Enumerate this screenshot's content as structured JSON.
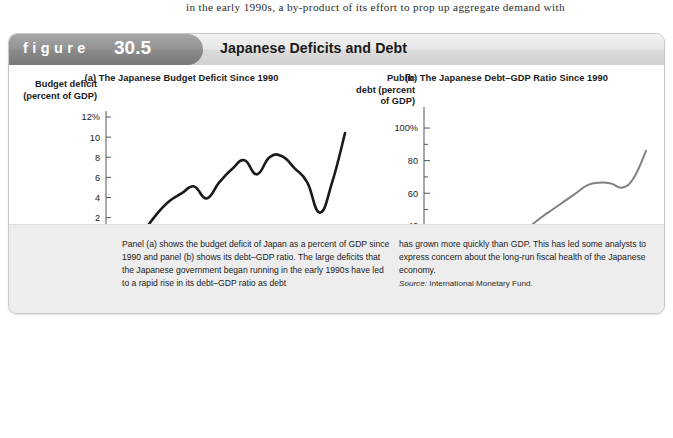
{
  "page": {
    "body_text_line": "in the early 1990s, a by-product of its effort to prop up aggregate demand with"
  },
  "figure": {
    "label_word": "figure",
    "number": "30.5",
    "title": "Japanese Deficits and Debt",
    "caption_left": "Panel (a) shows the budget deficit of Japan as a percent of GDP since 1990 and panel (b) shows its debt–GDP ratio. The large deficits that the Japanese government began running in the early 1990s have led to a rapid rise in its debt–GDP ratio as debt",
    "caption_right": "has grown more quickly than GDP. This has led some analysts to express concern about the long-run fiscal health of the Japanese economy.",
    "source_label": "Source:",
    "source_text": "International Monetary Fund."
  },
  "colors": {
    "line_a": "#1a1a1a",
    "line_b": "#808080",
    "axis": "#555555",
    "zero_line": "#8c8c8c",
    "tab": "#8a8a8a",
    "caption_bg": "#ededed"
  },
  "chart_data": [
    {
      "type": "line",
      "panel": "a",
      "title": "(a) The Japanese Budget Deficit Since 1990",
      "xlabel": "Year",
      "ylabel": "Budget deficit (percent of GDP)",
      "ylabel_lines": [
        "Budget deficit",
        "(percent of GDP)"
      ],
      "yticks": [
        12,
        10,
        8,
        6,
        4,
        2,
        0,
        -2,
        -4
      ],
      "ytick_labels": [
        "12%",
        "10",
        "8",
        "6",
        "4",
        "2",
        "0",
        "-2",
        "-4"
      ],
      "ylim": [
        -4,
        12
      ],
      "xlim": [
        1990,
        2009
      ],
      "xticks": [
        1990,
        1991,
        1992,
        1993,
        1994,
        1995,
        1996,
        1997,
        1998,
        1999,
        2000,
        2001,
        2002,
        2003,
        2004,
        2005,
        2006,
        2007,
        2008,
        2009
      ],
      "xtick_labels": [
        "1990",
        "1992",
        "1994",
        "1996",
        "1998",
        "2000",
        "2002",
        "2004",
        "2006",
        "2008",
        "2009"
      ],
      "xtick_label_years": [
        1990,
        1992,
        1994,
        1996,
        1998,
        2000,
        2002,
        2004,
        2006,
        2008,
        2009
      ],
      "zero_reference_line": 0,
      "grid": false,
      "legend": "none",
      "x": [
        1990,
        1991,
        1992,
        1993,
        1994,
        1995,
        1996,
        1997,
        1998,
        1999,
        2000,
        2001,
        2002,
        2003,
        2004,
        2005,
        2006,
        2007,
        2008,
        2009
      ],
      "values": [
        -2.1,
        -2.0,
        -1.5,
        0.6,
        2.3,
        3.6,
        4.4,
        5.1,
        3.9,
        5.5,
        6.8,
        7.7,
        6.3,
        8.0,
        8.1,
        6.9,
        5.5,
        2.5,
        5.6,
        10.4
      ]
    },
    {
      "type": "line",
      "panel": "b",
      "title": "(b) The Japanese Debt–GDP Ratio Since 1990",
      "xlabel": "Year",
      "ylabel": "Public debt (percent of GDP)",
      "ylabel_lines": [
        "Public",
        "debt (percent",
        "of GDP)"
      ],
      "yticks": [
        100,
        80,
        60,
        40,
        20
      ],
      "ytick_labels": [
        "100%",
        "80",
        "60",
        "40",
        "20"
      ],
      "ylim": [
        8,
        108
      ],
      "xlim": [
        1990,
        2009
      ],
      "xtick_labels": [
        "1990",
        "1992",
        "1994",
        "1996",
        "1998",
        "2000",
        "2002",
        "2004",
        "2006",
        "2008",
        "2009"
      ],
      "xtick_label_years": [
        1990,
        1992,
        1994,
        1996,
        1998,
        2000,
        2002,
        2004,
        2006,
        2008,
        2009
      ],
      "grid": false,
      "legend": "none",
      "x": [
        1990,
        1991,
        1992,
        1993,
        1994,
        1995,
        1996,
        1997,
        1998,
        1999,
        2000,
        2001,
        2002,
        2003,
        2004,
        2005,
        2006,
        2007,
        2008,
        2009
      ],
      "values": [
        14.0,
        12.5,
        13.0,
        15.0,
        17.5,
        20.0,
        23.0,
        26.5,
        31.0,
        39.0,
        45.0,
        50.0,
        55.0,
        60.0,
        65.0,
        66.5,
        66.0,
        63.5,
        70.0,
        86.0
      ]
    }
  ]
}
